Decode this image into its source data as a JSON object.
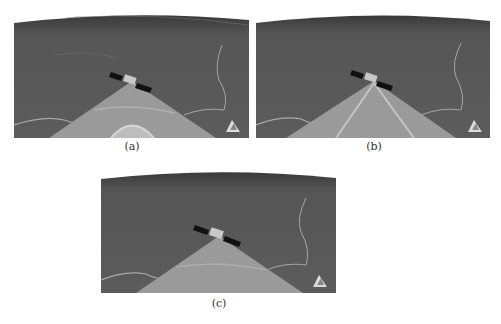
{
  "figure": {
    "panels": [
      {
        "id": "a",
        "caption": "(a)",
        "beam_variant": "single-ring",
        "description": "Satellite above terrain projecting a single triangular beam footprint with a bright arc near the bottom"
      },
      {
        "id": "b",
        "caption": "(b)",
        "beam_variant": "split-lines",
        "description": "Satellite above terrain projecting a triangular beam with two inner diverging lines"
      },
      {
        "id": "c",
        "caption": "(c)",
        "beam_variant": "uniform",
        "description": "Satellite above terrain projecting a uniform triangular beam footprint"
      }
    ],
    "colors": {
      "terrain": "#5a5a5a",
      "terrain_dark": "#4a4a4a",
      "beam": "#9a9a9a",
      "river": "#b8b8b8",
      "solar_panel": "#111111",
      "horizon": "#2e2e2e"
    }
  }
}
